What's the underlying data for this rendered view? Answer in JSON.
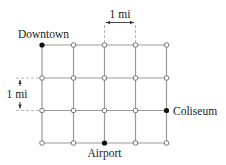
{
  "diagram": {
    "type": "street-grid",
    "columns": 5,
    "rows": 4,
    "col_x": [
      42,
      73.5,
      104.5,
      135.5,
      166.5
    ],
    "row_y": [
      45,
      78,
      110.5,
      143
    ],
    "colors": {
      "line": "#9a9a9a",
      "node_fill_open": "#ffffff",
      "node_fill_landmark": "#111111",
      "text": "#222222"
    },
    "landmarks": [
      {
        "name": "downtown",
        "label": "Downtown",
        "col": 0,
        "row": 0
      },
      {
        "name": "coliseum",
        "label": "Coliseum",
        "col": 4,
        "row": 2
      },
      {
        "name": "airport",
        "label": "Airport",
        "col": 2,
        "row": 3
      }
    ],
    "scale_labels": {
      "horizontal": "1 mi",
      "vertical": "1 mi"
    }
  }
}
